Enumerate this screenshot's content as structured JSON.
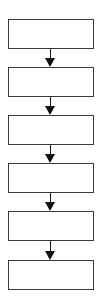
{
  "diagram": {
    "type": "flowchart",
    "direction": "top-to-bottom",
    "colors": {
      "stroke": "#3a3a3a",
      "arrow": "#111111",
      "background": "#ffffff"
    },
    "nodes": [
      {
        "id": 1,
        "label": ""
      },
      {
        "id": 2,
        "label": ""
      },
      {
        "id": 3,
        "label": ""
      },
      {
        "id": 4,
        "label": ""
      },
      {
        "id": 5,
        "label": ""
      },
      {
        "id": 6,
        "label": ""
      }
    ],
    "edges": [
      {
        "from": 1,
        "to": 2
      },
      {
        "from": 2,
        "to": 3
      },
      {
        "from": 3,
        "to": 4
      },
      {
        "from": 4,
        "to": 5
      },
      {
        "from": 5,
        "to": 6
      }
    ]
  }
}
